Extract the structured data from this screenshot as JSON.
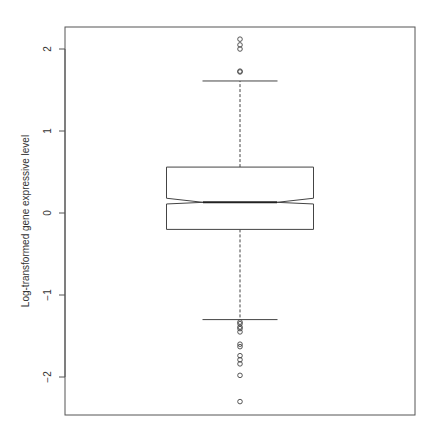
{
  "chart_data": {
    "type": "boxplot",
    "title": "",
    "xlabel": "",
    "ylabel": "Log-transformed gene expressive level",
    "ylim": [
      -2.45,
      2.3
    ],
    "yticks": [
      -2,
      -1,
      0,
      1,
      2
    ],
    "grid": false,
    "notched": true,
    "boxes": [
      {
        "lower_whisker": -1.3,
        "q1": -0.2,
        "notch_lower": 0.11,
        "median": 0.13,
        "notch_upper": 0.18,
        "q3": 0.56,
        "upper_whisker": 1.61,
        "outliers": [
          2.12,
          2.05,
          2.0,
          1.73,
          1.72,
          -1.33,
          -1.35,
          -1.39,
          -1.41,
          -1.45,
          -1.6,
          -1.63,
          -1.74,
          -1.79,
          -1.84,
          -1.98,
          -2.3
        ]
      }
    ]
  },
  "axis": {
    "ylabel": "Log-transformed gene expressive level",
    "ticks": [
      "2",
      "1",
      "0",
      "-1",
      "-2"
    ]
  }
}
